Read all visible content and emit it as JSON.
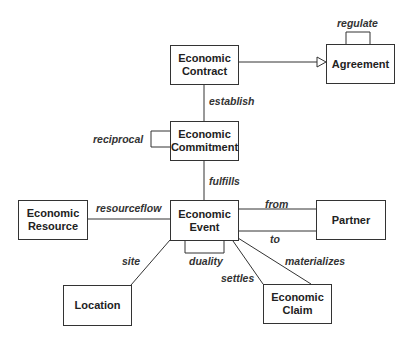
{
  "diagram": {
    "type": "uml-class-diagram",
    "classes": [
      {
        "id": "economic-contract",
        "label": "Economic\nContract",
        "line1": "Economic",
        "line2": "Contract"
      },
      {
        "id": "agreement",
        "label": "Agreement",
        "line1": "Agreement"
      },
      {
        "id": "economic-commitment",
        "label": "Economic\nCommitment",
        "line1": "Economic",
        "line2": "Commitment"
      },
      {
        "id": "economic-resource",
        "label": "Economic\nResource",
        "line1": "Economic",
        "line2": "Resource"
      },
      {
        "id": "economic-event",
        "label": "Economic\nEvent",
        "line1": "Economic",
        "line2": "Event"
      },
      {
        "id": "partner",
        "label": "Partner",
        "line1": "Partner"
      },
      {
        "id": "location",
        "label": "Location",
        "line1": "Location"
      },
      {
        "id": "economic-claim",
        "label": "Economic\nClaim",
        "line1": "Economic",
        "line2": "Claim"
      }
    ],
    "relationships": [
      {
        "label": "regulate",
        "from": "agreement",
        "to": "agreement",
        "kind": "self-association"
      },
      {
        "label": "",
        "from": "economic-contract",
        "to": "agreement",
        "kind": "generalization"
      },
      {
        "label": "establish",
        "from": "economic-contract",
        "to": "economic-commitment",
        "kind": "association"
      },
      {
        "label": "reciprocal",
        "from": "economic-commitment",
        "to": "economic-commitment",
        "kind": "self-association"
      },
      {
        "label": "fulfills",
        "from": "economic-commitment",
        "to": "economic-event",
        "kind": "association"
      },
      {
        "label": "resourceflow",
        "from": "economic-resource",
        "to": "economic-event",
        "kind": "association"
      },
      {
        "label": "from",
        "from": "economic-event",
        "to": "partner",
        "kind": "association"
      },
      {
        "label": "to",
        "from": "economic-event",
        "to": "partner",
        "kind": "association"
      },
      {
        "label": "duality",
        "from": "economic-event",
        "to": "economic-event",
        "kind": "self-association"
      },
      {
        "label": "site",
        "from": "economic-event",
        "to": "location",
        "kind": "association"
      },
      {
        "label": "settles",
        "from": "economic-event",
        "to": "economic-claim",
        "kind": "association"
      },
      {
        "label": "materializes",
        "from": "economic-event",
        "to": "economic-claim",
        "kind": "association"
      }
    ]
  },
  "labels": {
    "regulate": "regulate",
    "establish": "establish",
    "reciprocal": "reciprocal",
    "fulfills": "fulfills",
    "resourceflow": "resourceflow",
    "from": "from",
    "to": "to",
    "duality": "duality",
    "site": "site",
    "settles": "settles",
    "materializes": "materializes"
  }
}
